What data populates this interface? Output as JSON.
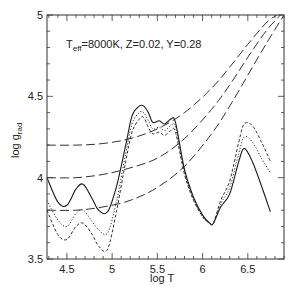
{
  "chart_data": {
    "type": "line",
    "title": "",
    "annotation": {
      "text_main": "T",
      "text_sub": "eff",
      "text_rest": "=8000K, Z=0.02, Y=0.28"
    },
    "xlabel": "log T",
    "ylabel_main": "log g",
    "ylabel_sub": "rad",
    "xlim": [
      4.28,
      6.9
    ],
    "ylim": [
      3.5,
      5.0
    ],
    "xticks": [
      4.5,
      5,
      5.5,
      6,
      6.5
    ],
    "xtick_labels": [
      "4.5",
      "5",
      "5.5",
      "6",
      "6.5"
    ],
    "yticks": [
      3.5,
      4,
      4.5,
      5
    ],
    "ytick_labels": [
      "3.5",
      "4",
      "4.5",
      "5"
    ],
    "grid": false,
    "legend": null,
    "series": [
      {
        "name": "solid",
        "style": "solid",
        "x": [
          4.28,
          4.4,
          4.5,
          4.6,
          4.68,
          4.78,
          4.85,
          4.95,
          5.05,
          5.15,
          5.22,
          5.3,
          5.35,
          5.4,
          5.45,
          5.52,
          5.58,
          5.65,
          5.7,
          5.8,
          5.9,
          6.0,
          6.08,
          6.12,
          6.2,
          6.3,
          6.4,
          6.46,
          6.55,
          6.65,
          6.75
        ],
        "y": [
          4.0,
          3.85,
          3.83,
          3.93,
          3.96,
          3.87,
          3.8,
          3.79,
          3.95,
          4.2,
          4.38,
          4.44,
          4.44,
          4.4,
          4.34,
          4.35,
          4.33,
          4.36,
          4.34,
          4.05,
          3.88,
          3.77,
          3.72,
          3.72,
          3.82,
          3.9,
          4.1,
          4.18,
          4.1,
          3.95,
          3.79
        ]
      },
      {
        "name": "dotted",
        "style": "dotted",
        "x": [
          4.28,
          4.4,
          4.5,
          4.6,
          4.68,
          4.78,
          4.85,
          4.95,
          5.05,
          5.15,
          5.22,
          5.3,
          5.35,
          5.4,
          5.45,
          5.52,
          5.58,
          5.65,
          5.7,
          5.8,
          5.9,
          6.0,
          6.08,
          6.12,
          6.2,
          6.3,
          6.4,
          6.46,
          6.55,
          6.65,
          6.75
        ],
        "y": [
          3.86,
          3.74,
          3.7,
          3.78,
          3.8,
          3.73,
          3.68,
          3.66,
          3.86,
          4.15,
          4.33,
          4.4,
          4.4,
          4.35,
          4.3,
          4.31,
          4.29,
          4.32,
          4.31,
          4.04,
          3.87,
          3.76,
          3.72,
          3.72,
          3.84,
          3.94,
          4.15,
          4.25,
          4.22,
          4.12,
          4.03
        ]
      },
      {
        "name": "short-dashed",
        "style": "short-dash",
        "x": [
          4.28,
          4.4,
          4.5,
          4.6,
          4.68,
          4.78,
          4.85,
          4.95,
          5.05,
          5.15,
          5.22,
          5.3,
          5.35,
          5.4,
          5.45,
          5.52,
          5.58,
          5.65,
          5.7,
          5.8,
          5.9,
          6.0,
          6.08,
          6.12,
          6.2,
          6.3,
          6.4,
          6.46,
          6.55,
          6.65,
          6.75
        ],
        "y": [
          3.8,
          3.65,
          3.62,
          3.7,
          3.72,
          3.65,
          3.58,
          3.56,
          3.8,
          4.1,
          4.28,
          4.36,
          4.37,
          4.31,
          4.27,
          4.28,
          4.26,
          4.29,
          4.28,
          4.02,
          3.86,
          3.76,
          3.72,
          3.72,
          3.86,
          3.98,
          4.22,
          4.33,
          4.32,
          4.22,
          4.1
        ]
      },
      {
        "name": "long-dashed-upper",
        "style": "long-dash",
        "x": [
          4.28,
          4.6,
          4.9,
          5.2,
          5.5,
          5.8,
          6.1,
          6.3,
          6.5,
          6.7,
          6.82
        ],
        "y": [
          4.2,
          4.2,
          4.21,
          4.24,
          4.3,
          4.4,
          4.55,
          4.68,
          4.82,
          4.95,
          5.0
        ]
      },
      {
        "name": "long-dashed-middle",
        "style": "long-dash",
        "x": [
          4.28,
          4.6,
          4.9,
          5.2,
          5.5,
          5.8,
          6.1,
          6.3,
          6.5,
          6.7,
          6.86
        ],
        "y": [
          4.0,
          4.0,
          4.02,
          4.06,
          4.12,
          4.24,
          4.42,
          4.57,
          4.74,
          4.9,
          5.0
        ]
      },
      {
        "name": "long-dashed-lower",
        "style": "long-dash",
        "x": [
          4.28,
          4.6,
          4.9,
          5.2,
          5.5,
          5.8,
          6.1,
          6.3,
          6.5,
          6.7,
          6.9
        ],
        "y": [
          3.8,
          3.8,
          3.82,
          3.86,
          3.94,
          4.07,
          4.27,
          4.44,
          4.63,
          4.82,
          5.0
        ]
      }
    ]
  },
  "colors": {
    "axis": "#333333",
    "line": "#1a1a1a",
    "background": "#ffffff"
  }
}
